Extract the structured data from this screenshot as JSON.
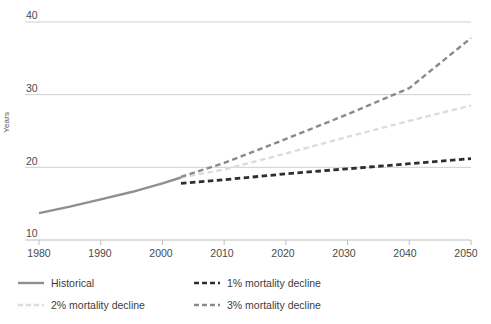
{
  "chart_data": {
    "type": "line",
    "title": "",
    "subtitle": "",
    "xlabel": "",
    "ylabel": "Years",
    "xlim": [
      1980,
      2050
    ],
    "ylim": [
      10,
      40
    ],
    "xticks": [
      1980,
      1990,
      2000,
      2010,
      2020,
      2030,
      2040,
      2050
    ],
    "yticks": [
      10,
      20,
      30,
      40
    ],
    "grid": "horizontal",
    "legend_position": "bottom",
    "series": [
      {
        "name": "Historical",
        "style": "solid",
        "color": "#8f8f8f",
        "x": [
          1980,
          1985,
          1990,
          1995,
          2000,
          2003
        ],
        "values": [
          13.7,
          14.6,
          15.6,
          16.6,
          17.8,
          18.6
        ]
      },
      {
        "name": "1% mortality decline",
        "style": "dashed",
        "color": "#2e2e2e",
        "x": [
          2003,
          2010,
          2020,
          2030,
          2040,
          2050
        ],
        "values": [
          17.8,
          18.3,
          19.1,
          19.8,
          20.5,
          21.2
        ]
      },
      {
        "name": "2% mortality decline",
        "style": "dashed",
        "color": "#dcdcdc",
        "x": [
          2003,
          2010,
          2020,
          2030,
          2040,
          2050
        ],
        "values": [
          18.6,
          19.7,
          21.9,
          24.2,
          26.4,
          28.5
        ]
      },
      {
        "name": "3% mortality decline",
        "style": "dashed",
        "color": "#8a8a8a",
        "x": [
          2003,
          2010,
          2020,
          2030,
          2040,
          2050
        ],
        "values": [
          18.7,
          20.6,
          23.9,
          27.3,
          30.9,
          37.8
        ]
      }
    ]
  },
  "axis": {
    "y_tick_labels": [
      "40",
      "30",
      "20",
      "10"
    ],
    "x_tick_labels": [
      "1980",
      "1990",
      "2000",
      "2010",
      "2020",
      "2030",
      "2040",
      "2050"
    ],
    "y_axis_title": "Years"
  },
  "legend": {
    "items": [
      {
        "label": "Historical"
      },
      {
        "label": "1% mortality decline"
      },
      {
        "label": "2% mortality decline"
      },
      {
        "label": "3% mortality decline"
      }
    ]
  },
  "colors": {
    "historical": "#8f8f8f",
    "decline_1": "#2e2e2e",
    "decline_2": "#dcdcdc",
    "decline_3": "#8a8a8a",
    "gridline": "#cfcfcf",
    "axis": "#bdbdbd",
    "text": "#4a4a4a"
  }
}
